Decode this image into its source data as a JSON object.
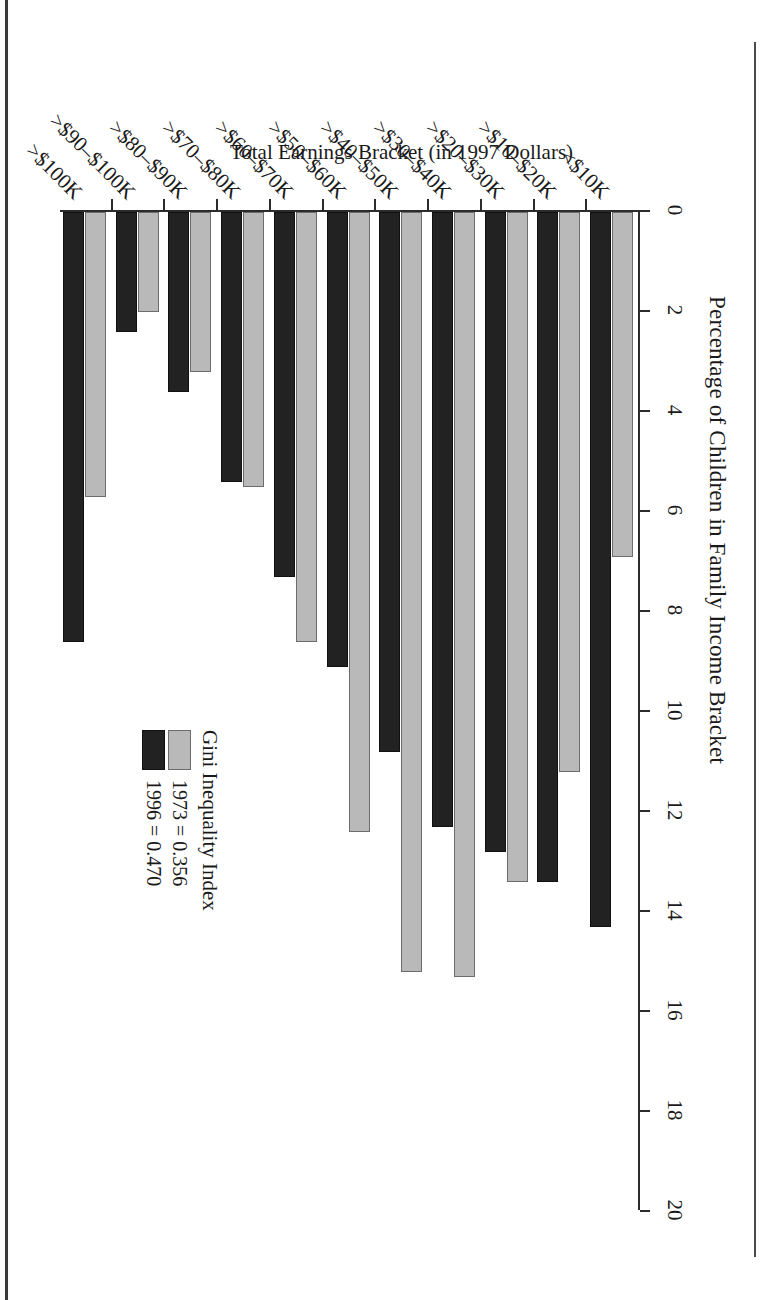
{
  "chart_data": {
    "type": "bar",
    "orientation": "horizontal",
    "title": "",
    "xlabel": "Percentage of Children in Family Income Bracket",
    "ylabel": "Total Earnings Bracket (in 1997 Dollars)",
    "xlim": [
      0,
      20
    ],
    "xticks": [
      0,
      2,
      4,
      6,
      8,
      10,
      12,
      14,
      16,
      18,
      20
    ],
    "xtick_labels": [
      "0",
      "2",
      "4",
      "6",
      "8",
      "10",
      "12",
      "14",
      "16",
      "18",
      "20"
    ],
    "grid": false,
    "legend_position": "center-right",
    "legend_title": "Gini Inequality Index",
    "categories": [
      "<$10K",
      ">$10–$20K",
      ">$20–$30K",
      ">$30–$40K",
      ">$40–$50K",
      ">$50–$60K",
      ">$60–$70K",
      ">$70–$80K",
      ">$80–$90K",
      ">$90–$100K",
      ">$100K"
    ],
    "series": [
      {
        "name": "1973 = 0.356",
        "color": "#b9b9b9",
        "values": [
          6.9,
          11.2,
          13.4,
          15.3,
          15.2,
          12.4,
          8.6,
          5.5,
          3.2,
          2.0,
          5.7
        ]
      },
      {
        "name": "1996 = 0.470",
        "color": "#222222",
        "values": [
          14.3,
          13.4,
          12.8,
          12.3,
          10.8,
          9.1,
          7.3,
          5.4,
          3.6,
          2.4,
          8.6
        ]
      }
    ]
  },
  "figure": {
    "value_axis_title": "Percentage of Children in Family Income Bracket",
    "category_axis_title": "Total Earnings Bracket (in 1997 Dollars)"
  },
  "legend": {
    "title": "Gini Inequality Index",
    "entries": [
      {
        "label": "1973 = 0.356",
        "swatch": "gray"
      },
      {
        "label": "1996 = 0.470",
        "swatch": "black"
      }
    ]
  }
}
